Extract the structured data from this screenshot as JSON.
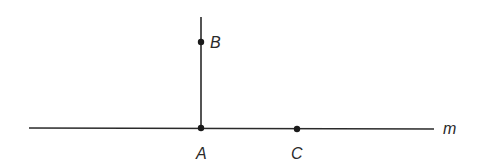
{
  "diagram": {
    "line_label": "m",
    "points": [
      {
        "name": "B",
        "x": 201,
        "y": 42
      },
      {
        "name": "A",
        "x": 201,
        "y": 128
      },
      {
        "name": "C",
        "x": 297,
        "y": 129
      }
    ],
    "colors": {
      "stroke": "#2a2a2a",
      "background": "#ffffff"
    }
  }
}
